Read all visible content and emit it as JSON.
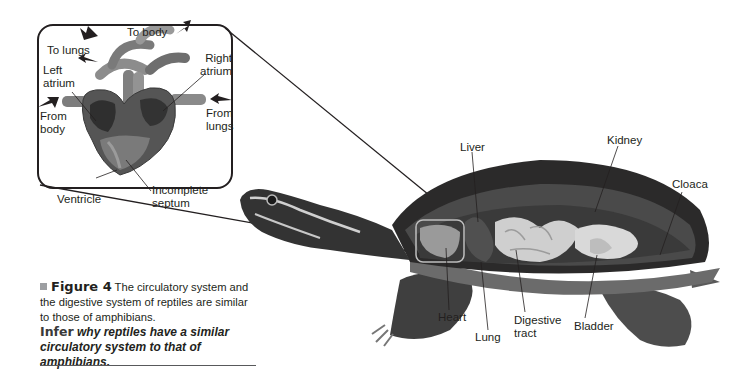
{
  "figure": {
    "number_label": "Figure 4",
    "caption": "The circulatory system and the digestive system of reptiles are similar to those of amphibians.",
    "infer_keyword": "Infer",
    "infer_question": "why reptiles have a similar circulatory system to that of amphibians."
  },
  "heart_inset": {
    "labels": {
      "to_body": "To body",
      "to_lungs": "To lungs",
      "left_atrium": [
        "Left",
        "atrium"
      ],
      "right_atrium": [
        "Right",
        "atrium"
      ],
      "from_body": [
        "From",
        "body"
      ],
      "from_lungs": [
        "From",
        "lungs"
      ],
      "ventricle": "Ventricle",
      "incomplete_septum": [
        "Incomplete",
        "septum"
      ]
    }
  },
  "turtle": {
    "labels": {
      "liver": "Liver",
      "kidney": "Kidney",
      "cloaca": "Cloaca",
      "heart": "Heart",
      "lung": "Lung",
      "digestive_tract": [
        "Digestive",
        "tract"
      ],
      "bladder": "Bladder"
    }
  },
  "colors": {
    "ink": "#231f20",
    "caption_bullet": "#9d9fa2",
    "shell_dark": "#2b2a2a",
    "organ_light": "#d8d8d8",
    "skin_mid": "#5a5a5a"
  }
}
